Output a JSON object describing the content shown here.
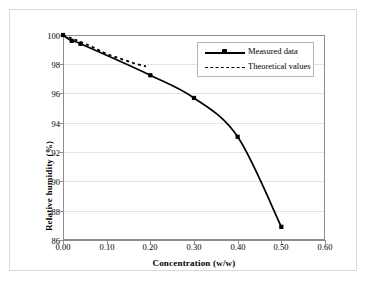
{
  "chart_data": {
    "type": "line",
    "title": "",
    "xlabel": "Concentration (w/w)",
    "ylabel": "Relative humidity (%)",
    "xlim": [
      0.0,
      0.6
    ],
    "ylim": [
      86,
      100
    ],
    "xticks": [
      "0.00",
      "0.10",
      "0.20",
      "0.30",
      "0.40",
      "0.50",
      "0.60"
    ],
    "yticks": [
      "86",
      "88",
      "90",
      "92",
      "94",
      "96",
      "98",
      "100"
    ],
    "grid": "horizontal",
    "legend_position": "upper-right",
    "series": [
      {
        "name": "Measured data",
        "style": "solid-with-markers",
        "x": [
          0.0,
          0.02,
          0.04,
          0.2,
          0.3,
          0.4,
          0.5
        ],
        "y": [
          100.0,
          99.6,
          99.4,
          97.25,
          95.7,
          93.05,
          86.9
        ]
      },
      {
        "name": "Theoretical values",
        "style": "dotted",
        "x": [
          0.0,
          0.03,
          0.05,
          0.07,
          0.09,
          0.11,
          0.13,
          0.15,
          0.17,
          0.19
        ],
        "y": [
          100.0,
          99.65,
          99.4,
          99.15,
          98.85,
          98.6,
          98.4,
          98.2,
          98.0,
          97.85
        ]
      }
    ]
  },
  "legend": {
    "items": [
      {
        "label": "Measured data"
      },
      {
        "label": "Theoretical values"
      }
    ]
  },
  "colors": {
    "line": "#000000",
    "grid": "#e3e3e3",
    "axis": "#8d8d8d",
    "frame": "#d9d9d9",
    "background": "#ffffff"
  }
}
